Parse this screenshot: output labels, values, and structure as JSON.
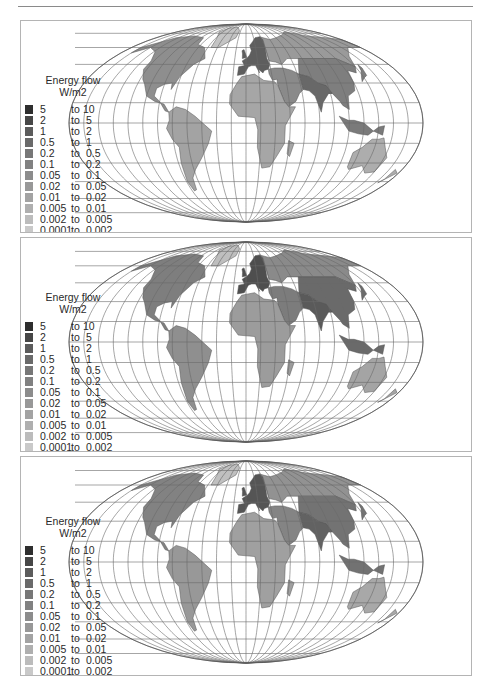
{
  "figure": {
    "panels": [
      {
        "id": "panel-1",
        "legend_title": "Energy flow",
        "legend_unit": "W/m2"
      },
      {
        "id": "panel-2",
        "legend_title": "Energy flow",
        "legend_unit": "W/m2"
      },
      {
        "id": "panel-3",
        "legend_title": "Energy flow",
        "legend_unit": "W/m2"
      }
    ],
    "legend": {
      "connector": "to",
      "classes": [
        {
          "from": "5",
          "to": "10",
          "color": "#2e2e2e"
        },
        {
          "from": "2",
          "to": "5",
          "color": "#474747"
        },
        {
          "from": "1",
          "to": "2",
          "color": "#5c5c5c"
        },
        {
          "from": "0.5",
          "to": "1",
          "color": "#6a6a6a"
        },
        {
          "from": "0.2",
          "to": "0.5",
          "color": "#777777"
        },
        {
          "from": "0.1",
          "to": "0.2",
          "color": "#818181"
        },
        {
          "from": "0.05",
          "to": "0.1",
          "color": "#8c8c8c"
        },
        {
          "from": "0.02",
          "to": "0.05",
          "color": "#989898"
        },
        {
          "from": "0.01",
          "to": "0.02",
          "color": "#a3a3a3"
        },
        {
          "from": "0.005",
          "to": "0.01",
          "color": "#afafaf"
        },
        {
          "from": "0.002",
          "to": "0.005",
          "color": "#bcbcbc"
        },
        {
          "from": "0.0001",
          "to": "0.002",
          "color": "#c9c9c9"
        }
      ]
    },
    "projection": "Mollweide world map with graticule",
    "map_colors": {
      "panel-1": {
        "north_america": "#8e8e8e",
        "south_america": "#a3a3a3",
        "europe": "#5e5e5e",
        "africa": "#a6a6a6",
        "russia": "#9a9a9a",
        "asia": "#7e7e7e",
        "india": "#686868",
        "australia": "#adadad",
        "greenland": "#c4c4c4",
        "middle_east": "#8a8a8a",
        "indonesia": "#7a7a7a"
      },
      "panel-2": {
        "north_america": "#7e7e7e",
        "south_america": "#8f8f8f",
        "europe": "#4e4e4e",
        "africa": "#9c9c9c",
        "russia": "#8a8a8a",
        "asia": "#6a6a6a",
        "india": "#5a5a5a",
        "australia": "#a4a4a4",
        "greenland": "#bebebe",
        "middle_east": "#7c7c7c",
        "indonesia": "#6a6a6a"
      },
      "panel-3": {
        "north_america": "#828282",
        "south_america": "#989898",
        "europe": "#555555",
        "africa": "#a0a0a0",
        "russia": "#929292",
        "asia": "#737373",
        "india": "#626262",
        "australia": "#a8a8a8",
        "greenland": "#c0c0c0",
        "middle_east": "#848484",
        "indonesia": "#727272"
      }
    }
  }
}
